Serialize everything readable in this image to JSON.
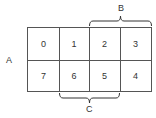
{
  "diagram": {
    "type": "karnaugh-style grid",
    "rows": [
      [
        "0",
        "1",
        "2",
        "3"
      ],
      [
        "7",
        "6",
        "5",
        "4"
      ]
    ],
    "labels": {
      "A": "A",
      "B": "B",
      "C": "C"
    },
    "braces": {
      "B": {
        "spans_columns": [
          2,
          3
        ],
        "position": "top"
      },
      "C": {
        "spans_columns": [
          1,
          2
        ],
        "position": "bottom"
      }
    },
    "row_label_A": {
      "spans_rows": [
        0,
        1
      ],
      "position": "left"
    }
  }
}
